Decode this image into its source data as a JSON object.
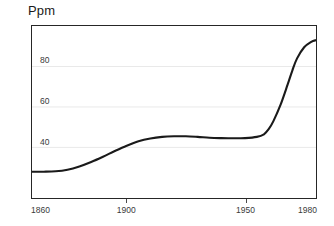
{
  "chart_data": {
    "type": "line",
    "title": "",
    "subtitle": "",
    "xlabel": "",
    "ylabel": "Ppm",
    "ylabel_position": "top-left",
    "grid": true,
    "grid_axis": "y",
    "legend": false,
    "legend_position": "none",
    "xlim": [
      1860,
      1980
    ],
    "ylim": [
      15,
      100
    ],
    "xticks": [
      1860,
      1900,
      1950,
      1980
    ],
    "xtick_labels": [
      "1860",
      "1900",
      "1950",
      "1980"
    ],
    "yticks": [
      40,
      60,
      80
    ],
    "ytick_labels": [
      "40",
      "60",
      "80"
    ],
    "series": [
      {
        "name": "Ppm",
        "color": "#1a1a1a",
        "line_width": 2.1,
        "x": [
          1860,
          1865,
          1870,
          1875,
          1880,
          1885,
          1890,
          1895,
          1900,
          1905,
          1910,
          1915,
          1920,
          1925,
          1930,
          1935,
          1940,
          1945,
          1950,
          1955,
          1958,
          1960,
          1962,
          1965,
          1968,
          1970,
          1972,
          1975,
          1978,
          1980
        ],
        "y": [
          28.0,
          28.0,
          28.2,
          29.0,
          30.6,
          32.8,
          35.4,
          38.2,
          40.8,
          43.0,
          44.4,
          45.2,
          45.5,
          45.5,
          45.2,
          44.8,
          44.6,
          44.5,
          44.6,
          45.2,
          46.5,
          49.0,
          53.0,
          61.0,
          71.0,
          78.0,
          84.0,
          89.5,
          92.2,
          93.0
        ]
      }
    ],
    "gridline_color": "#e9e9e9",
    "axis_color": "#262626",
    "background": "#ffffff"
  },
  "axis_labels": {
    "y_unit": "Ppm",
    "y_40": "40",
    "y_60": "60",
    "y_80": "80",
    "x_1860": "1860",
    "x_1900": "1900",
    "x_1950": "1950",
    "x_1980": "1980"
  }
}
